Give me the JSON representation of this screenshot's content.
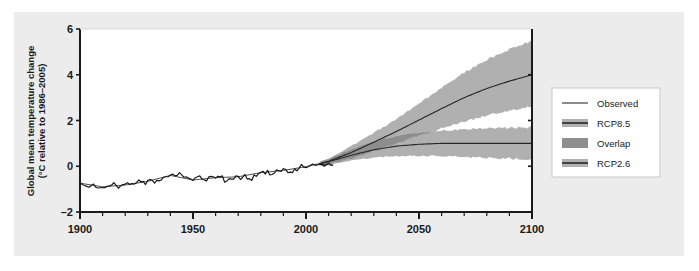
{
  "chart_data": {
    "type": "line",
    "title": "",
    "xlabel": "",
    "ylabel": "Global mean temperature change",
    "ylabel_line2": "(°C relative to 1986–2005)",
    "xlim": [
      1900,
      2100
    ],
    "ylim": [
      -2,
      6
    ],
    "xticks": [
      1900,
      1950,
      2000,
      2050,
      2100
    ],
    "xtick_labels": [
      "1900",
      "1950",
      "2000",
      "2050",
      "2100"
    ],
    "xminor_step": 10,
    "yticks": [
      -2,
      0,
      2,
      4,
      6
    ],
    "ytick_labels": [
      "–2",
      "0",
      "2",
      "4",
      "6"
    ],
    "grid": false,
    "legend_position": "right-outside",
    "series": [
      {
        "name": "Observed",
        "type": "line",
        "color": "#1a1a1a",
        "x": [
          1900,
          1901,
          1902,
          1903,
          1904,
          1905,
          1906,
          1907,
          1908,
          1909,
          1910,
          1911,
          1912,
          1913,
          1914,
          1915,
          1916,
          1917,
          1918,
          1919,
          1920,
          1921,
          1922,
          1923,
          1924,
          1925,
          1926,
          1927,
          1928,
          1929,
          1930,
          1931,
          1932,
          1933,
          1934,
          1935,
          1936,
          1937,
          1938,
          1939,
          1940,
          1941,
          1942,
          1943,
          1944,
          1945,
          1946,
          1947,
          1948,
          1949,
          1950,
          1951,
          1952,
          1953,
          1954,
          1955,
          1956,
          1957,
          1958,
          1959,
          1960,
          1961,
          1962,
          1963,
          1964,
          1965,
          1966,
          1967,
          1968,
          1969,
          1970,
          1971,
          1972,
          1973,
          1974,
          1975,
          1976,
          1977,
          1978,
          1979,
          1980,
          1981,
          1982,
          1983,
          1984,
          1985,
          1986,
          1987,
          1988,
          1989,
          1990,
          1991,
          1992,
          1993,
          1994,
          1995,
          1996,
          1997,
          1998,
          1999,
          2000,
          2001,
          2002,
          2003,
          2004,
          2005,
          2006,
          2007,
          2008,
          2009,
          2010,
          2011,
          2012
        ],
        "values": [
          -0.72,
          -0.8,
          -0.84,
          -0.88,
          -0.92,
          -0.84,
          -0.78,
          -0.92,
          -0.95,
          -0.94,
          -0.93,
          -0.94,
          -0.88,
          -0.86,
          -0.82,
          -0.72,
          -0.84,
          -0.96,
          -0.86,
          -0.8,
          -0.78,
          -0.72,
          -0.8,
          -0.76,
          -0.78,
          -0.72,
          -0.6,
          -0.68,
          -0.66,
          -0.8,
          -0.62,
          -0.58,
          -0.62,
          -0.74,
          -0.62,
          -0.64,
          -0.6,
          -0.48,
          -0.46,
          -0.46,
          -0.38,
          -0.34,
          -0.42,
          -0.4,
          -0.28,
          -0.38,
          -0.48,
          -0.46,
          -0.52,
          -0.56,
          -0.62,
          -0.5,
          -0.46,
          -0.42,
          -0.56,
          -0.6,
          -0.64,
          -0.46,
          -0.44,
          -0.46,
          -0.52,
          -0.44,
          -0.46,
          -0.42,
          -0.7,
          -0.64,
          -0.54,
          -0.56,
          -0.56,
          -0.42,
          -0.44,
          -0.58,
          -0.48,
          -0.36,
          -0.56,
          -0.54,
          -0.62,
          -0.38,
          -0.44,
          -0.32,
          -0.26,
          -0.22,
          -0.34,
          -0.18,
          -0.38,
          -0.36,
          -0.3,
          -0.16,
          -0.2,
          -0.22,
          -0.1,
          -0.14,
          -0.28,
          -0.26,
          -0.28,
          -0.12,
          -0.2,
          -0.08,
          0.08,
          -0.04,
          -0.06,
          -0.02,
          0.04,
          0.1,
          0.04,
          0.06,
          0.1,
          0.08,
          0.0,
          0.06,
          0.14,
          0.06,
          0.04
        ]
      },
      {
        "name": "Observed (second dataset)",
        "type": "line",
        "color": "#1a1a1a",
        "x": [
          1900,
          1910,
          1920,
          1930,
          1940,
          1950,
          1960,
          1970,
          1980,
          1990,
          2000,
          2005,
          2012
        ],
        "values": [
          -0.74,
          -0.9,
          -0.82,
          -0.66,
          -0.4,
          -0.6,
          -0.5,
          -0.46,
          -0.28,
          -0.18,
          -0.02,
          0.1,
          0.05
        ]
      },
      {
        "name": "RCP8.5",
        "type": "band+line",
        "band_color": "#b0b0b0",
        "line_color": "#262626",
        "x": [
          2006,
          2010,
          2020,
          2030,
          2040,
          2050,
          2060,
          2070,
          2080,
          2090,
          2100
        ],
        "values": [
          0.1,
          0.22,
          0.6,
          1.05,
          1.52,
          2.02,
          2.52,
          3.0,
          3.4,
          3.72,
          4.0
        ],
        "lower": [
          0.02,
          0.1,
          0.34,
          0.66,
          1.0,
          1.34,
          1.66,
          1.96,
          2.22,
          2.44,
          2.62
        ],
        "upper": [
          0.18,
          0.34,
          0.88,
          1.46,
          2.06,
          2.74,
          3.42,
          4.1,
          4.66,
          5.1,
          5.5
        ]
      },
      {
        "name": "RCP2.6",
        "type": "band+line",
        "band_color": "#b0b0b0",
        "line_color": "#262626",
        "x": [
          2006,
          2010,
          2020,
          2030,
          2040,
          2050,
          2060,
          2070,
          2080,
          2090,
          2100
        ],
        "values": [
          0.1,
          0.2,
          0.48,
          0.72,
          0.88,
          0.96,
          1.0,
          1.0,
          1.0,
          1.0,
          1.0
        ],
        "lower": [
          0.02,
          0.08,
          0.24,
          0.38,
          0.44,
          0.46,
          0.44,
          0.4,
          0.36,
          0.34,
          0.32
        ],
        "upper": [
          0.18,
          0.32,
          0.74,
          1.08,
          1.32,
          1.46,
          1.56,
          1.62,
          1.66,
          1.68,
          1.7
        ]
      }
    ],
    "overlap_note": "Region where RCP8.5 and RCP2.6 uncertainty bands overlap is shaded darker"
  },
  "legend": {
    "items": [
      {
        "label": "Observed",
        "swatch": "thin-line",
        "color": "#1a1a1a"
      },
      {
        "label": "RCP8.5",
        "swatch": "band-line",
        "band_color": "#b0b0b0",
        "line_color": "#262626"
      },
      {
        "label": "Overlap",
        "swatch": "solid-block",
        "color": "#8e8e8e"
      },
      {
        "label": "RCP2.6",
        "swatch": "band-line",
        "band_color": "#b0b0b0",
        "line_color": "#262626"
      }
    ]
  },
  "colors": {
    "panel_background": "#ececec",
    "plot_background": "#ffffff",
    "axis": "#1a1a1a",
    "band": "#b0b0b0",
    "overlap": "#8e8e8e",
    "line": "#262626",
    "legend_border": "#c8c8c8"
  }
}
